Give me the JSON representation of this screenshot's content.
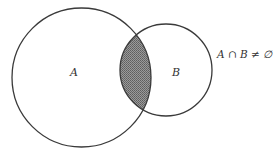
{
  "diagram": {
    "type": "venn",
    "sets": [
      {
        "name": "A",
        "label": "A",
        "cx": 81.5,
        "cy": 77.5,
        "r": 69.5
      },
      {
        "name": "B",
        "label": "B",
        "cx": 166,
        "cy": 70,
        "r": 46
      }
    ],
    "intersection": {
      "shaded": true,
      "fill": "#7a7a7a"
    },
    "annotation": "A ∩ B ≠ ∅",
    "colors": {
      "stroke": "#3a3a3a",
      "background": "#ffffff",
      "shade": "#7a7a7a"
    }
  }
}
